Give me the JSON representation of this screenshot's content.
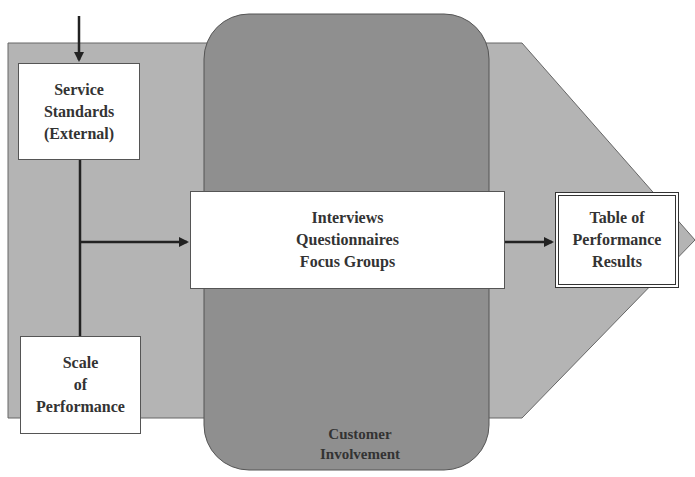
{
  "diagram": {
    "colors": {
      "background": "#ffffff",
      "pentagon_fill": "#b4b4b4",
      "rounded_rect_fill": "#8f8f8f",
      "box_fill": "#ffffff",
      "line": "#222222",
      "text": "#333333"
    },
    "nodes": {
      "service_standards": {
        "lines": [
          "Service",
          "Standards",
          "(External)"
        ]
      },
      "scale_of_performance": {
        "lines": [
          "Scale",
          "of",
          "Performance"
        ]
      },
      "methods": {
        "lines": [
          "Interviews",
          "Questionnaires",
          "Focus Groups"
        ]
      },
      "results": {
        "lines": [
          "Table of",
          "Performance",
          "Results"
        ]
      },
      "customer_involvement": {
        "lines": [
          "Customer",
          "Involvement"
        ]
      }
    },
    "edges": [
      {
        "from": "external-input",
        "to": "service_standards"
      },
      {
        "from": "service_standards",
        "to": "scale_of_performance",
        "type": "line"
      },
      {
        "from": "vertical-connector",
        "to": "methods"
      },
      {
        "from": "methods",
        "to": "results"
      }
    ]
  }
}
